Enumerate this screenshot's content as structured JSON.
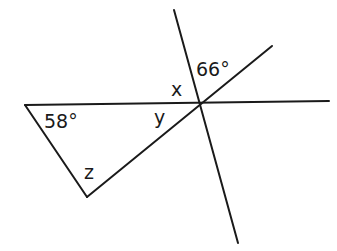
{
  "diagram": {
    "type": "geometry-angles",
    "stroke_color": "#1a1a1a",
    "background": "#ffffff",
    "labels": {
      "angle_58": "58°",
      "angle_66": "66°",
      "x": "x",
      "y": "y",
      "z": "z"
    },
    "lines": [
      {
        "name": "horizontal-line",
        "from": [
          25,
          105
        ],
        "to": [
          329,
          101
        ]
      },
      {
        "name": "steep-transversal",
        "from": [
          174,
          10
        ],
        "to": [
          238,
          243
        ]
      },
      {
        "name": "diagonal-line",
        "from": [
          87,
          197
        ],
        "to": [
          272,
          46
        ]
      },
      {
        "name": "triangle-left-side",
        "from": [
          25,
          105
        ],
        "to": [
          87,
          197
        ]
      }
    ]
  }
}
